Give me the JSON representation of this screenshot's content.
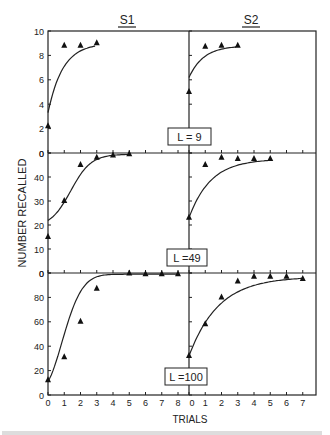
{
  "chart_data": {
    "type": "line",
    "title": "",
    "xlabel": "TRIALS",
    "ylabel": "NUMBER RECALLED",
    "columns": [
      "S1",
      "S2"
    ],
    "grid": false,
    "panels": [
      {
        "label": "L = 9",
        "ylim": [
          0,
          10
        ],
        "yticks": [
          0,
          2,
          4,
          6,
          8,
          10
        ],
        "S1": {
          "x": [
            0,
            1,
            2,
            3
          ],
          "y": [
            2.2,
            8.8,
            8.8,
            9.0
          ],
          "fit_start": 3.3
        },
        "S2": {
          "x": [
            0,
            1,
            2,
            3
          ],
          "y": [
            5.0,
            8.7,
            8.8,
            8.8
          ],
          "fit_start": 6.2
        }
      },
      {
        "label": "L =49",
        "ylim": [
          0,
          50
        ],
        "yticks": [
          0,
          10,
          20,
          30,
          40,
          50
        ],
        "S1": {
          "x": [
            0,
            1,
            2,
            3,
            4,
            5
          ],
          "y": [
            15,
            30,
            45,
            48,
            49,
            49.5
          ],
          "fit_start": 19
        },
        "S2": {
          "x": [
            0,
            1,
            2,
            3,
            4,
            5
          ],
          "y": [
            23,
            45,
            48,
            47.5,
            47.5,
            47.5
          ],
          "fit_start": 23
        }
      },
      {
        "label": "L =100",
        "ylim": [
          0,
          100
        ],
        "yticks": [
          0,
          20,
          40,
          60,
          80,
          100
        ],
        "S1": {
          "x": [
            0,
            1,
            2,
            3,
            5,
            6,
            7,
            8
          ],
          "y": [
            12,
            31,
            60,
            87,
            99.5,
            99,
            99,
            99
          ],
          "fit_start": 11
        },
        "S2": {
          "x": [
            0,
            1,
            2,
            3,
            4,
            5,
            6,
            7
          ],
          "y": [
            32,
            58,
            80,
            93,
            97,
            97,
            97,
            95
          ],
          "fit_start": 32
        }
      }
    ],
    "xticks_S1": [
      0,
      1,
      2,
      3,
      4,
      5,
      6,
      7,
      8
    ],
    "xticks_S2": [
      0,
      1,
      2,
      3,
      4,
      5,
      6,
      7
    ]
  },
  "labels": {
    "col1": "S1",
    "col2": "S2",
    "xlabel": "TRIALS",
    "ylabel": "NUMBER RECALLED",
    "panel1": "L = 9",
    "panel2": "L =49",
    "panel3": "L =100"
  }
}
